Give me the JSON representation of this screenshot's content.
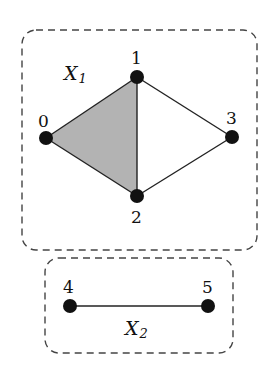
{
  "complexes": [
    {
      "name": "X",
      "subscript": "1"
    },
    {
      "name": "X",
      "subscript": "2"
    }
  ],
  "nodes": [
    {
      "id": "0",
      "label": "0"
    },
    {
      "id": "1",
      "label": "1"
    },
    {
      "id": "2",
      "label": "2"
    },
    {
      "id": "3",
      "label": "3"
    },
    {
      "id": "4",
      "label": "4"
    },
    {
      "id": "5",
      "label": "5"
    }
  ],
  "edges": [
    [
      "0",
      "1"
    ],
    [
      "0",
      "2"
    ],
    [
      "1",
      "2"
    ],
    [
      "1",
      "3"
    ],
    [
      "2",
      "3"
    ],
    [
      "4",
      "5"
    ]
  ],
  "faces": [
    [
      "0",
      "1",
      "2"
    ]
  ],
  "colors": {
    "face": "#b3b3b3",
    "node": "#111111",
    "edge": "#222222",
    "box": "#444444"
  }
}
